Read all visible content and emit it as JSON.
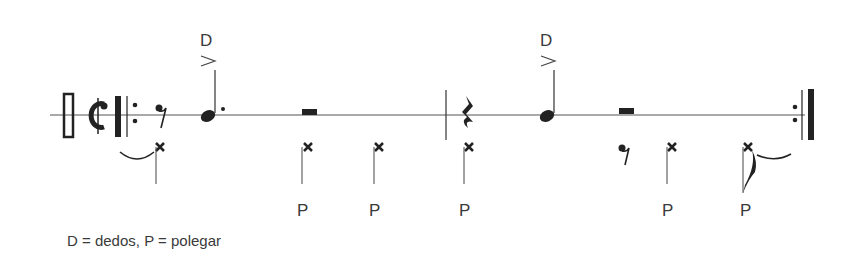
{
  "notation": {
    "staff": "single-line percussion staff",
    "clef": "percussion-clef",
    "time_signature": "cut-time (alla breve)",
    "repeat": "start and end repeat barlines",
    "measures": [
      {
        "upper_voice": [
          "eighth-rest",
          "dotted-quarter-note (accent, D)",
          "half-rest"
        ],
        "lower_voice": [
          "x-note (tied from previous)",
          "x-note P",
          "x-note P"
        ]
      },
      {
        "upper_voice": [
          "quarter-rest",
          "quarter-note (accent, D)",
          "half-rest"
        ],
        "lower_voice": [
          "x-note P",
          "eighth-rest",
          "x-note P",
          "x-note P (eighth, tied over repeat)"
        ]
      }
    ]
  },
  "labels": {
    "d1": "D",
    "d2": "D",
    "p1": "P",
    "p2": "P",
    "p3": "P",
    "p4": "P",
    "p5": "P"
  },
  "legend": "D = dedos, P = polegar",
  "colors": {
    "ink": "#2a2a2a",
    "text": "#3a3a3a"
  }
}
